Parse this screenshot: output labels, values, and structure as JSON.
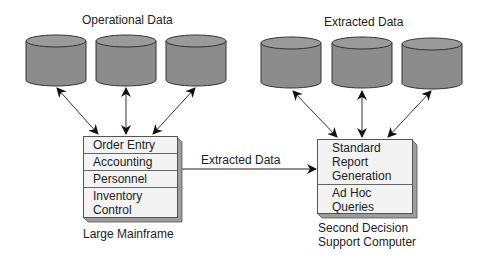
{
  "diagram": {
    "left_group": {
      "title": "Operational Data",
      "databases": 3,
      "system": {
        "label": "Large Mainframe",
        "modules": [
          {
            "lines": [
              "Order Entry"
            ]
          },
          {
            "lines": [
              "Accounting"
            ]
          },
          {
            "lines": [
              "Personnel"
            ]
          },
          {
            "lines": [
              "Inventory",
              "Control"
            ]
          }
        ]
      }
    },
    "right_group": {
      "title": "Extracted Data",
      "databases": 3,
      "system": {
        "label_lines": [
          "Second Decision",
          "Support Computer"
        ],
        "modules": [
          {
            "lines": [
              "Standard",
              "Report",
              "Generation"
            ]
          },
          {
            "lines": [
              "Ad Hoc",
              "Queries"
            ]
          }
        ]
      }
    },
    "connector": {
      "label": "Extracted Data",
      "from": "Large Mainframe",
      "to": "Second Decision Support Computer"
    },
    "colors": {
      "cylinder_fill": "#8c8c8c",
      "cylinder_top": "#9a9a9a",
      "box_fill": "#f3f3f3",
      "box_shadow": "#9d9d9d",
      "line": "#222222"
    }
  }
}
